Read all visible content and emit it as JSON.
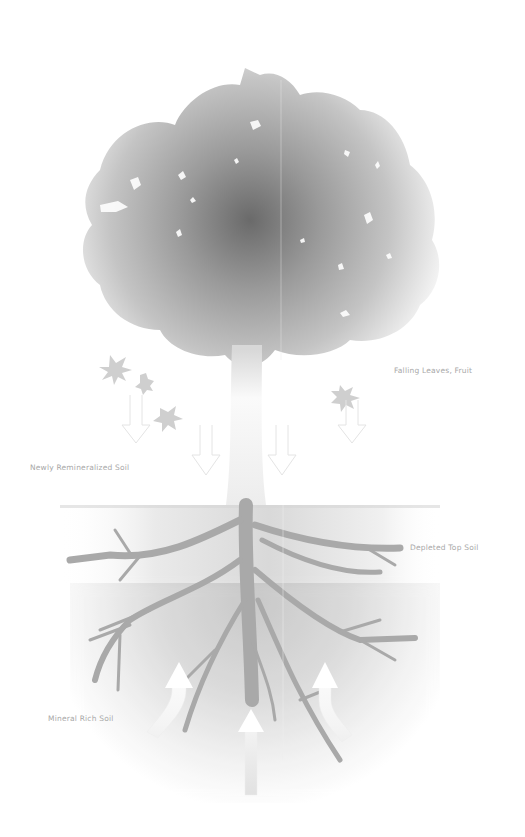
{
  "diagram": {
    "type": "nutrient-cycle-illustration",
    "labels": {
      "falling_leaves": "Falling Leaves, Fruit",
      "newly_remineralized": "Newly Remineralized Soil",
      "depleted_top_soil": "Depleted Top Soil",
      "mineral_rich_soil": "Mineral Rich Soil"
    },
    "flows": [
      {
        "from": "canopy",
        "to": "top soil",
        "direction": "down",
        "count": 5
      },
      {
        "from": "mineral rich soil",
        "to": "roots",
        "direction": "up",
        "count": 3
      }
    ],
    "colors": {
      "background": "#ffffff",
      "canopy_core": "#6a6a6a",
      "canopy_edge": "#d8d8d8",
      "soil_band": "#c8c8c8",
      "roots": "#a9a9a9",
      "label_text": "#a8a8a8",
      "arrow_fill": "#ffffff"
    }
  }
}
